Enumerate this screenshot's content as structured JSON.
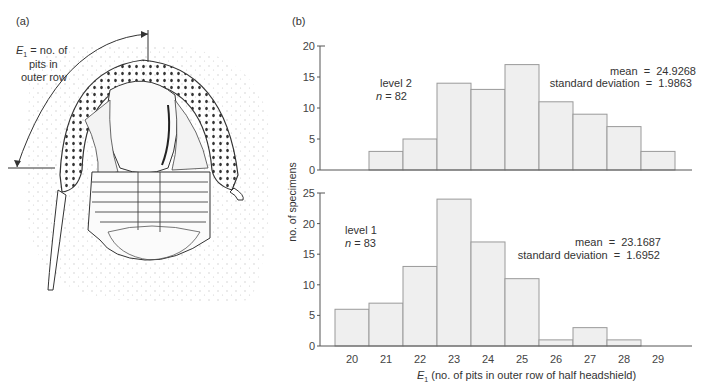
{
  "panel_a": {
    "label": "(a)",
    "annotation_var": "E",
    "annotation_sub": "1",
    "annotation_line1": " = no. of",
    "annotation_line2": "pits in",
    "annotation_line3": "outer row"
  },
  "panel_b": {
    "label": "(b)",
    "ylabel": "no. of specimens",
    "xlabel_var": "E",
    "xlabel_sub": "1",
    "xlabel_rest": " (no. of pits in outer row of half headshield)"
  },
  "chart_data": [
    {
      "type": "bar",
      "title": "level 2",
      "n_label": "n",
      "n_value": "= 82",
      "stats_mean": "mean  =  24.9268",
      "stats_sd": "standard deviation  =  1.9863",
      "categories": [
        "20",
        "21",
        "22",
        "23",
        "24",
        "25",
        "26",
        "27",
        "28",
        "29"
      ],
      "values": [
        0,
        3,
        5,
        14,
        13,
        17,
        11,
        9,
        7,
        3
      ],
      "ylim": [
        0,
        20
      ],
      "yticks": [
        "0",
        "5",
        "10",
        "15",
        "20"
      ],
      "xlabel": "",
      "ylabel": "no. of specimens"
    },
    {
      "type": "bar",
      "title": "level 1",
      "n_label": "n",
      "n_value": "= 83",
      "stats_mean": "mean  =  23.1687",
      "stats_sd": "standard deviation  =  1.6952",
      "categories": [
        "20",
        "21",
        "22",
        "23",
        "24",
        "25",
        "26",
        "27",
        "28",
        "29"
      ],
      "values": [
        6,
        7,
        13,
        24,
        17,
        11,
        1,
        3,
        1,
        0
      ],
      "ylim": [
        0,
        25
      ],
      "yticks": [
        "0",
        "5",
        "10",
        "15",
        "20",
        "25"
      ],
      "xlabel": "E1 (no. of pits in outer row of half headshield)",
      "ylabel": "no. of specimens"
    }
  ],
  "colors": {
    "bar_fill": "#efefef",
    "bar_stroke": "#9a9a9a",
    "axis": "#555555",
    "stipple": "#c8c8c8",
    "ink": "#333333"
  }
}
